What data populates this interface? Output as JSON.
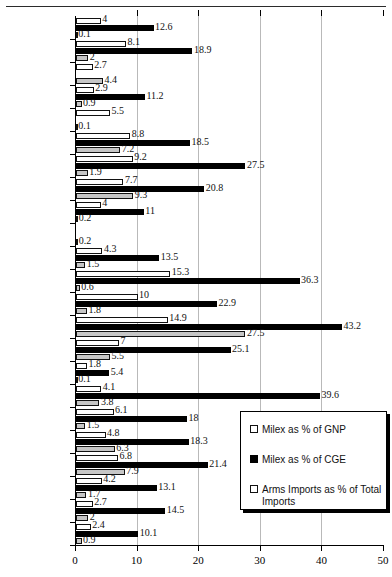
{
  "chart_data": {
    "type": "bar",
    "orientation": "horizontal",
    "title": "",
    "xlabel": "",
    "ylabel": "",
    "xlim": [
      0,
      50
    ],
    "xticks": [
      0,
      10,
      20,
      30,
      40,
      50
    ],
    "grid": true,
    "legend_position": "inside-right-lower",
    "categories": [
      "Algeria",
      "Bahrain",
      "Egypt",
      "Iran",
      "Iraq",
      "Israel",
      "Jordan",
      "Kuwait",
      "Lebanon",
      "Libya",
      "Morocco",
      "Oman",
      "Qatar",
      "Saudi Arabia",
      "Syria",
      "Tunisia",
      "UAE",
      "Yemen",
      "OPEC",
      "Middle East",
      "North Africa",
      "Developing",
      "World"
    ],
    "series": [
      {
        "name": "Milex as % of GNP",
        "swatch": "gnp",
        "color": "#ffffff",
        "values": [
          4,
          8.1,
          2.7,
          2.9,
          5.5,
          8.8,
          9.2,
          7.7,
          4,
          null,
          4.3,
          15.3,
          10,
          14.9,
          7,
          1.8,
          4.1,
          6.1,
          4.8,
          6.8,
          4.2,
          2.7,
          2.4
        ]
      },
      {
        "name": "Milex as % of CGE",
        "swatch": "cge",
        "color": "#000000",
        "values": [
          12.6,
          18.9,
          null,
          11.2,
          null,
          18.5,
          27.5,
          20.8,
          11,
          null,
          13.5,
          36.3,
          22.9,
          43.2,
          25.1,
          5.4,
          39.6,
          18,
          18.3,
          21.4,
          13.1,
          14.5,
          10.1
        ]
      },
      {
        "name": "Arms Imports as % of Total Imports",
        "swatch": "arms",
        "color": "#c6c6c6",
        "values": [
          0.1,
          2,
          4.4,
          0.9,
          0.1,
          7.2,
          1.9,
          9.3,
          0.2,
          0.2,
          1.5,
          0.6,
          1.8,
          27.5,
          5.5,
          0.1,
          3.8,
          1.5,
          6.3,
          7.9,
          1.7,
          2,
          0.9
        ]
      }
    ]
  },
  "legend": {
    "items": [
      "Milex as % of GNP",
      "Milex as % of CGE",
      "Arms Imports as % of Total Imports"
    ]
  }
}
